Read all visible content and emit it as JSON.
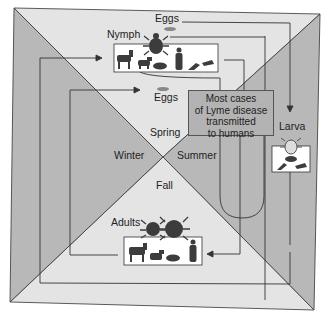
{
  "diagram": {
    "seasons": {
      "spring": "Spring",
      "summer": "Summer",
      "fall": "Fall",
      "winter": "Winter"
    },
    "stages": {
      "eggs_top": "Eggs",
      "eggs_inner": "Eggs",
      "nymph": "Nymph",
      "larva": "Larva",
      "adults": "Adults"
    },
    "callout": {
      "line1": "Most cases",
      "line2": "of Lyme disease",
      "line3": "transmitted",
      "line4": "to humans"
    },
    "hosts": {
      "nymph": [
        "deer",
        "dog",
        "mouse",
        "human",
        "bird",
        "chipmunk"
      ],
      "larva": [
        "mouse",
        "bird",
        "chipmunk"
      ],
      "adults": [
        "deer",
        "dog",
        "raccoon",
        "human"
      ]
    },
    "colors": {
      "light_fill": "#e2e2e2",
      "dark_fill": "#b4b4b4",
      "line": "#3a3a3a",
      "silhouette": "#3c3c3c"
    }
  }
}
